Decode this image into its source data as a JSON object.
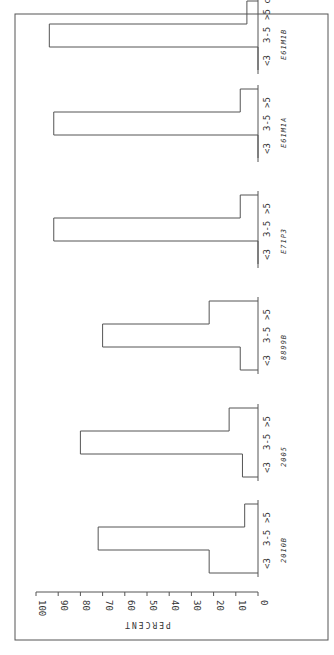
{
  "chart_data": {
    "type": "bar",
    "orientation": "rotated-90",
    "title": "",
    "xlabel": "",
    "ylabel": "PERCENT",
    "ylim": [
      0,
      100
    ],
    "yticks": [
      "0",
      "10",
      "20",
      "30",
      "40",
      "50",
      "60",
      "70",
      "80",
      "90",
      "100"
    ],
    "bar_categories": [
      "<3",
      "3-5",
      ">5"
    ],
    "unit_suffix": "cm",
    "groups": [
      {
        "name": "2010B",
        "values": [
          22,
          72,
          6
        ]
      },
      {
        "name": "2005",
        "values": [
          7,
          80,
          13
        ]
      },
      {
        "name": "8899B",
        "values": [
          8,
          70,
          22
        ]
      },
      {
        "name": "E71P3",
        "values": [
          0,
          92,
          8
        ]
      },
      {
        "name": "E61M1A",
        "values": [
          0,
          92,
          8
        ]
      },
      {
        "name": "E61M1B",
        "values": [
          0,
          94,
          5
        ]
      }
    ],
    "grid": false,
    "legend": "none"
  }
}
